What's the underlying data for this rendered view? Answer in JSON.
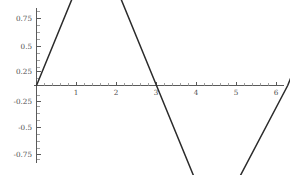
{
  "chart_data": {
    "type": "line",
    "title": "",
    "subtitle": "",
    "xlabel": "",
    "ylabel": "",
    "grid": false,
    "legend": false,
    "legend_position": "none",
    "xlim": [
      0,
      6.45
    ],
    "ylim": [
      -0.95,
      0.95
    ],
    "xticks": [
      1,
      2,
      3,
      4,
      5,
      6
    ],
    "xtick_labels": [
      "1",
      "2",
      "3",
      "4",
      "5",
      "6"
    ],
    "yticks": [
      0.75,
      0.5,
      0.25,
      -0.25,
      -0.5,
      -0.75
    ],
    "ytick_labels": [
      "0.75",
      "0.5",
      "0.25",
      "-0.25",
      "-0.5",
      "-0.75"
    ],
    "x_minor_tick_step": 0.2,
    "y_minor_tick_step": 0.05,
    "series": [
      {
        "name": "trapezoid-wave",
        "color": "#2b2b2b",
        "x": [
          0,
          1,
          2,
          3,
          4,
          5,
          6.28,
          6.45
        ],
        "y": [
          0,
          0.87,
          0.87,
          0,
          -0.87,
          -0.87,
          0,
          0.15
        ],
        "points": [
          {
            "x": 0,
            "y": 0
          },
          {
            "x": 1,
            "y": 0.87
          },
          {
            "x": 2,
            "y": 0.87
          },
          {
            "x": 3,
            "y": 0
          },
          {
            "x": 4,
            "y": -0.87
          },
          {
            "x": 5,
            "y": -0.87
          },
          {
            "x": 6.28,
            "y": 0
          },
          {
            "x": 6.45,
            "y": 0.15
          }
        ]
      }
    ],
    "annotations": []
  },
  "axes": {
    "axis_color": "#5a5a5a",
    "tick_color": "#5a5a5a",
    "minor_tick_color": "#8a8a8a",
    "label_color": "#4d4d4d",
    "background": "#ffffff",
    "x_axis_name": "horizontal-axis",
    "y_axis_name": "vertical-axis"
  }
}
